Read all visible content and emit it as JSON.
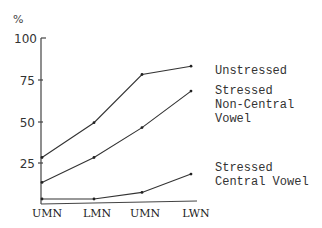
{
  "chart_data": {
    "type": "line",
    "title": "",
    "ylabel": "%",
    "xlabel": "",
    "ylim": [
      0,
      100
    ],
    "yticks": [
      25,
      50,
      75,
      100
    ],
    "categories": [
      "UMN",
      "LMN",
      "UMN",
      "LWN"
    ],
    "grid": false,
    "legend_position": "right (inline labels at line ends)",
    "series": [
      {
        "name": "Unstressed",
        "values": [
          28,
          49,
          78,
          83
        ]
      },
      {
        "name": "Stressed Non-Central Vowel",
        "values": [
          13,
          28,
          46,
          68
        ]
      },
      {
        "name": "Stressed Central Vowel",
        "values": [
          3,
          3,
          7,
          18
        ]
      }
    ]
  },
  "labels": {
    "unit": "%",
    "yticks": [
      "100",
      "75",
      "50",
      "25"
    ],
    "xticks": [
      "UMN",
      "LMN",
      "UMN",
      "LWN"
    ],
    "legend": {
      "unstressed": [
        "Unstressed"
      ],
      "noncentral": [
        "Stressed",
        "Non-Central",
        "Vowel"
      ],
      "central": [
        "Stressed",
        "Central Vowel"
      ]
    }
  }
}
